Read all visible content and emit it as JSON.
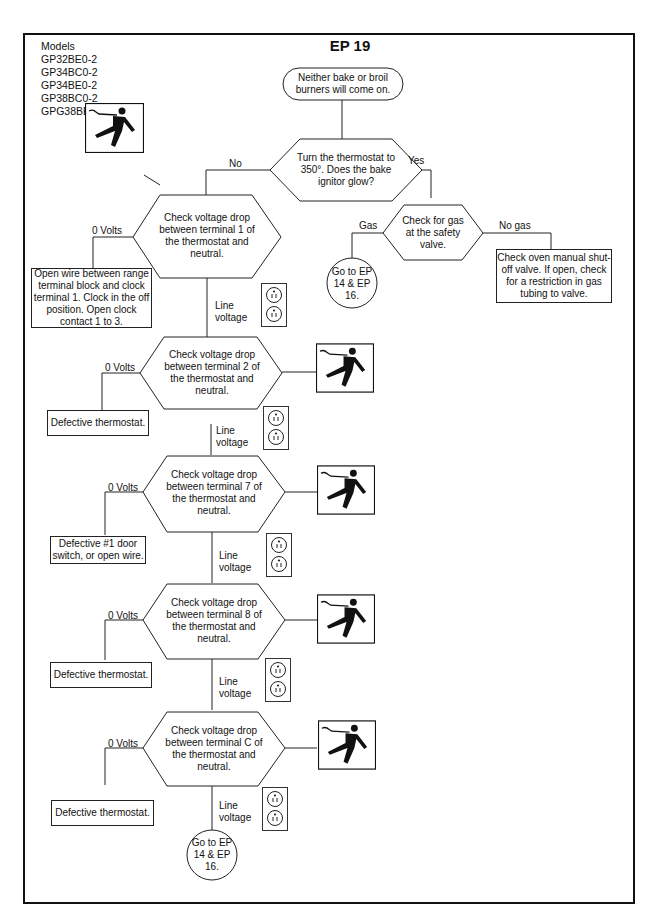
{
  "header": {
    "models_label": "Models",
    "models": [
      "GP32BE0-2",
      "GP34BC0-2",
      "GP34BE0-2",
      "GP38BC0-2",
      "GPG38BE0-4"
    ],
    "title": "EP 19"
  },
  "flow": {
    "start": "Neither bake or broil burners will come on.",
    "q1": {
      "text": "Turn the thermostat to 350°. Does the bake ignitor glow?",
      "no": "No",
      "yes": "Yes"
    },
    "gas_check": {
      "text": "Check for gas at the safety valve.",
      "gas": "Gas",
      "no_gas": "No gas"
    },
    "goto_top": "Go to EP 14 & EP 16.",
    "no_gas_result": "Check oven manual shut-off valve. If open, check for a restriction in gas tubing to valve.",
    "checks": [
      {
        "text": "Check voltage drop between terminal 1 of the thermostat and neutral.",
        "zero": "0 Volts",
        "line": "Line voltage",
        "fail": "Open wire between range terminal block and clock terminal 1.  Clock in the off position.  Open clock contact 1 to 3."
      },
      {
        "text": "Check voltage drop between terminal 2 of the thermostat and neutral.",
        "zero": "0 Volts",
        "line": "Line voltage",
        "fail": "Defective thermostat."
      },
      {
        "text": "Check voltage drop between terminal 7 of the thermostat and neutral.",
        "zero": "0 Volts",
        "line": "Line voltage",
        "fail": "Defective #1 door switch, or open wire."
      },
      {
        "text": "Check voltage drop between terminal 8 of the thermostat and neutral.",
        "zero": "0 Volts",
        "line": "Line voltage",
        "fail": "Defective thermostat."
      },
      {
        "text": "Check voltage drop between terminal C of the thermostat and neutral.",
        "zero": "0 Volts",
        "line": "Line voltage",
        "fail": "Defective thermostat."
      }
    ],
    "goto_bottom": "Go to EP 14 & EP 16."
  },
  "icons": {
    "shock": "electric-shock-hazard-icon",
    "outlet": "outlet-icon"
  }
}
